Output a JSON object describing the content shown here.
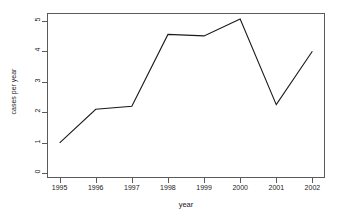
{
  "chart_data": {
    "type": "line",
    "title": "",
    "xlabel": "year",
    "ylabel": "cases per year",
    "categories": [
      "1995",
      "1996",
      "1997",
      "1998",
      "1999",
      "2000",
      "2001",
      "2002"
    ],
    "x": [
      1995,
      1996,
      1997,
      1998,
      1999,
      2000,
      2001,
      2002
    ],
    "values": [
      1.0,
      2.1,
      2.2,
      4.55,
      4.5,
      5.05,
      2.25,
      4.0
    ],
    "series": [
      {
        "name": "cases per year",
        "values": [
          1.0,
          2.1,
          2.2,
          4.55,
          4.5,
          5.05,
          2.25,
          4.0
        ]
      }
    ],
    "xlim": [
      1994.65,
      2002.35
    ],
    "ylim": [
      -0.15,
      5.25
    ],
    "ytick_labels": [
      "0",
      "1",
      "2",
      "3",
      "4",
      "5"
    ],
    "ytick_values": [
      0,
      1,
      2,
      3,
      4,
      5
    ],
    "xtick_labels": [
      "1995",
      "1996",
      "1997",
      "1998",
      "1999",
      "2000",
      "2001",
      "2002"
    ],
    "grid": false,
    "legend": false,
    "line_color": "#1a1a1a",
    "axis_color": "#5a5a5a",
    "background_color": "#ffffff"
  }
}
